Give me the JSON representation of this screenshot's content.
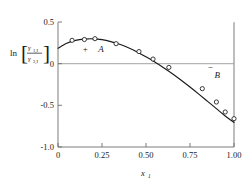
{
  "figure": {
    "background_color": "#ffffff",
    "ink_color": "#1a1a1a",
    "zero_line_color": "#9a9a9a",
    "frame_color": "#6e6e6e"
  },
  "axis": {
    "x_label_main": "x",
    "x_label_sub": "1",
    "x_ticks": [
      "0",
      "0.25",
      "0.50",
      "0.75",
      "1.00"
    ],
    "y_ticks": [
      "0.5",
      "0",
      "-0.5",
      "-1.0"
    ],
    "y_label_ln": "ln",
    "y_label_bracket_open": "[",
    "y_label_bracket_close": "]",
    "y_label_numer_gamma": "γ",
    "y_label_numer_sub": "1,I",
    "y_label_denom_gamma": "γ",
    "y_label_denom_sub": "2,I"
  },
  "annotations": [
    {
      "name": "region-a",
      "sign": "+",
      "letter": "A",
      "sign_x": 0.155,
      "sign_y": 0.175,
      "letter_x": 0.245,
      "letter_y": 0.175
    },
    {
      "name": "region-b",
      "sign": "−",
      "letter": "B",
      "sign_x": 0.865,
      "sign_y": -0.035,
      "letter_x": 0.905,
      "letter_y": -0.135
    }
  ],
  "chart_data": {
    "type": "scatter",
    "title": "",
    "xlabel": "x1",
    "ylabel": "ln(gamma_1,I / gamma_2,I)",
    "xlim": [
      0,
      1
    ],
    "ylim": [
      -1.0,
      0.5
    ],
    "grid": false,
    "legend": "none",
    "zero_reference_line": 0,
    "marker_style": "open-circle",
    "series": [
      {
        "name": "measured data",
        "x": [
          0.08,
          0.15,
          0.21,
          0.33,
          0.46,
          0.54,
          0.63,
          0.82,
          0.9,
          0.95,
          1.0
        ],
        "y": [
          0.28,
          0.29,
          0.3,
          0.24,
          0.145,
          0.055,
          -0.045,
          -0.3,
          -0.46,
          -0.58,
          -0.66
        ]
      },
      {
        "name": "fitted curve",
        "x": [
          0.0,
          0.05,
          0.1,
          0.15,
          0.2,
          0.25,
          0.3,
          0.35,
          0.4,
          0.45,
          0.5,
          0.55,
          0.6,
          0.65,
          0.7,
          0.75,
          0.8,
          0.85,
          0.9,
          0.95,
          1.0
        ],
        "y": [
          0.185,
          0.245,
          0.28,
          0.295,
          0.298,
          0.288,
          0.265,
          0.232,
          0.19,
          0.14,
          0.082,
          0.02,
          -0.048,
          -0.12,
          -0.198,
          -0.28,
          -0.365,
          -0.452,
          -0.54,
          -0.628,
          -0.705
        ]
      }
    ]
  }
}
